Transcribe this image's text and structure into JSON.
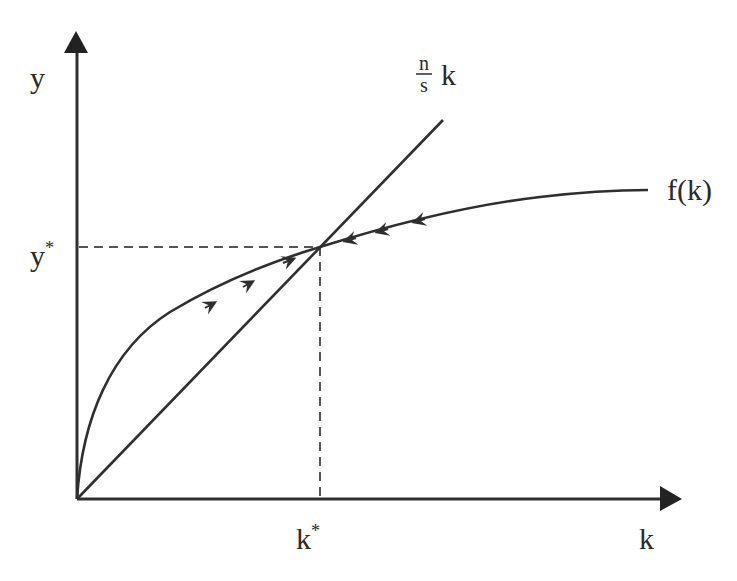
{
  "diagram": {
    "type": "economic-diagram",
    "colors": {
      "ink": "#2f2f2f",
      "background": "#ffffff",
      "dashed": "#555555"
    },
    "axes": {
      "x": {
        "label": "k",
        "tick_label": "k",
        "tick_sup": "*"
      },
      "y": {
        "label": "y",
        "tick_label": "y",
        "tick_sup": "*"
      }
    },
    "curves": [
      {
        "name": "production-function",
        "label": "f(k)",
        "shape": "concave",
        "arrows": "converge-to-steady-state"
      },
      {
        "name": "break-even-line",
        "label_num": "n",
        "label_den": "s",
        "label_var": "k",
        "shape": "linear"
      }
    ],
    "steady_state": {
      "k_label": "k*",
      "y_label": "y*"
    },
    "flow_arrows": {
      "left_of_steady_state": 3,
      "right_of_steady_state": 3
    }
  }
}
